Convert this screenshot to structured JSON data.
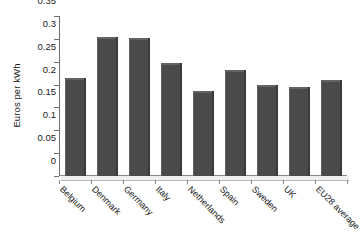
{
  "chart_data": {
    "type": "bar",
    "title": "",
    "subtitle": "",
    "xlabel": "",
    "ylabel": "Euros per kWh",
    "categories": [
      "Belgium",
      "Denmark",
      "Germany",
      "Italy",
      "Netherlands",
      "Spain",
      "Sweden",
      "UK",
      "EU28 average"
    ],
    "values": [
      0.215,
      0.305,
      0.303,
      0.248,
      0.186,
      0.231,
      0.199,
      0.195,
      0.211
    ],
    "ylim": [
      0,
      0.35
    ],
    "y_ticks": [
      0,
      0.05,
      0.1,
      0.15,
      0.2,
      0.25,
      0.3,
      0.35
    ],
    "y_tick_labels": [
      "0",
      "0.05",
      "0.1",
      "0.15",
      "0.2",
      "0.25",
      "0.3",
      "0.35"
    ],
    "grid": false,
    "legend": false,
    "legend_position": "none",
    "bar_color": "#4a4a4a",
    "background_color": "#ffffff",
    "axis_color": "#6e6e6e"
  }
}
